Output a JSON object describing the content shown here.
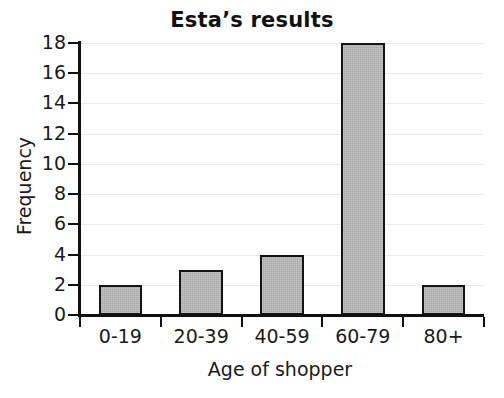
{
  "chart_data": {
    "type": "bar",
    "title": "Esta’s results",
    "xlabel": "Age of shopper",
    "ylabel": "Frequency",
    "categories": [
      "0-19",
      "20-39",
      "40-59",
      "60-79",
      "80+"
    ],
    "values": [
      2,
      3,
      4,
      18,
      2
    ],
    "ylim": [
      0,
      18
    ],
    "ytick_step": 2,
    "yticks": [
      0,
      2,
      4,
      6,
      8,
      10,
      12,
      14,
      16,
      18
    ],
    "ytick_labels": [
      "0",
      "2",
      "4",
      "6",
      "8",
      "10",
      "12",
      "14",
      "16",
      "18"
    ],
    "grid": true,
    "legend": false,
    "bar_fill_color": "#b6b6b6",
    "bar_edge_color": "#141414",
    "grid_color": "#eceaea",
    "axis_color": "#111111",
    "background_color": "#ffffff"
  }
}
